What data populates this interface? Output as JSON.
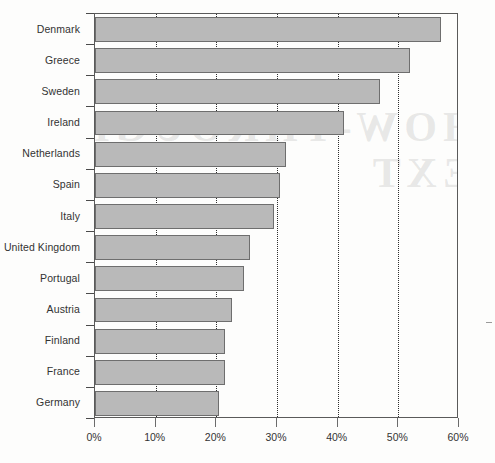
{
  "chart_data": {
    "type": "bar",
    "orientation": "horizontal",
    "title": "",
    "subtitle": "",
    "xlabel": "",
    "ylabel": "",
    "categories": [
      "Denmark",
      "Greece",
      "Sweden",
      "Ireland",
      "Netherlands",
      "Spain",
      "Italy",
      "United Kingdom",
      "Portugal",
      "Austria",
      "Finland",
      "France",
      "Germany"
    ],
    "values": [
      57,
      52,
      47,
      41,
      31.5,
      30.5,
      29.5,
      25.5,
      24.5,
      22.5,
      21.5,
      21.5,
      20.5
    ],
    "value_unit": "%",
    "xlim": [
      0,
      60
    ],
    "xticks": [
      0,
      10,
      20,
      30,
      40,
      50,
      60
    ],
    "xticklabels": [
      "0%",
      "10%",
      "20%",
      "30%",
      "40%",
      "50%",
      "60%"
    ],
    "gridlines": {
      "vertical_dotted_at": [
        10,
        20,
        30,
        40,
        50
      ],
      "horizontal": false
    },
    "legend": {
      "visible": false,
      "position": "none"
    },
    "colors": {
      "bar_fill": "#b9b9b9",
      "bar_border": "#6e6e6e",
      "axis": "#5a5a5a",
      "text": "#333333"
    }
  },
  "watermark": {
    "line1": "SHOW-THROUGH",
    "line2": "TEXT"
  }
}
